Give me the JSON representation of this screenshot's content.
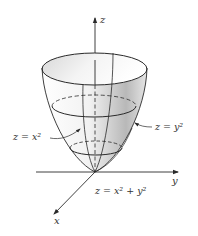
{
  "figure": {
    "type": "3d-surface-diagram",
    "surface": "paraboloid",
    "axes": {
      "z_label": "z",
      "y_label": "y",
      "x_label": "x"
    },
    "annotations": {
      "left_trace": "z = x²",
      "right_trace": "z = y²",
      "surface_equation": "z = x² + y²"
    },
    "colors": {
      "line": "#2a2a2a",
      "shade_light": "#ffffff",
      "shade_dark": "#9a9a9a"
    }
  }
}
